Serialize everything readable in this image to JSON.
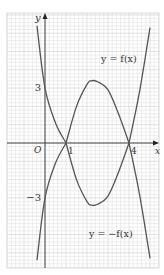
{
  "chart_data": {
    "type": "line",
    "title": "",
    "xlabel": "x",
    "ylabel": "y",
    "origin_label": "O",
    "x_ticks": [
      {
        "value": 1,
        "label": "1"
      },
      {
        "value": 4,
        "label": "4"
      }
    ],
    "y_ticks": [
      {
        "value": 3,
        "label": "3"
      },
      {
        "value": -3,
        "label": "−3"
      }
    ],
    "xlim": [
      -1.8,
      5.4
    ],
    "ylim": [
      -6.8,
      7.1
    ],
    "grid": true,
    "series": [
      {
        "name": "y = f(x)",
        "label": "y = f(x)",
        "points": [
          [
            -0.38,
            6.4
          ],
          [
            0,
            3
          ],
          [
            0.5,
            1.1
          ],
          [
            1,
            0
          ],
          [
            1.5,
            2.0
          ],
          [
            2,
            3.2
          ],
          [
            2.2,
            3.4
          ],
          [
            2.5,
            3.35
          ],
          [
            3,
            2.9
          ],
          [
            3.5,
            1.6
          ],
          [
            4,
            0
          ],
          [
            4.5,
            2.8
          ],
          [
            5,
            6.3
          ]
        ]
      },
      {
        "name": "y = -f(x)",
        "label": "y = −f(x)",
        "points": [
          [
            -0.38,
            -6.4
          ],
          [
            0,
            -3
          ],
          [
            0.5,
            -1.1
          ],
          [
            1,
            0
          ],
          [
            1.5,
            -2.0
          ],
          [
            2,
            -3.2
          ],
          [
            2.2,
            -3.4
          ],
          [
            2.5,
            -3.35
          ],
          [
            3,
            -2.9
          ],
          [
            3.5,
            -1.6
          ],
          [
            4,
            0
          ],
          [
            4.5,
            -2.8
          ],
          [
            5,
            -6.3
          ]
        ]
      }
    ],
    "annotations": [
      {
        "text": "y = f(x)",
        "near": [
          4.0,
          5.0
        ]
      },
      {
        "text": "y = −f(x)",
        "near": [
          3.3,
          -5.0
        ]
      }
    ],
    "colors": {
      "curve": "#555555",
      "axis": "#444444",
      "grid_minor": "#dcdcdc",
      "grid_major": "#c4c4c4"
    }
  }
}
